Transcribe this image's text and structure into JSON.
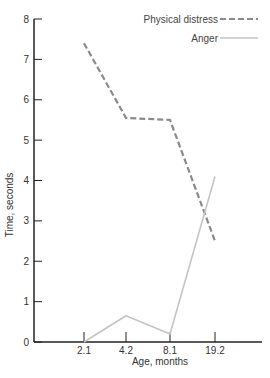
{
  "chart_data": {
    "type": "line",
    "title": "",
    "xlabel": "Age, months",
    "ylabel": "Time, seconds",
    "categories": [
      "2.1",
      "4.2",
      "8.1",
      "19.2"
    ],
    "ylim": [
      0,
      8
    ],
    "yticks": [
      "0",
      "1",
      "2",
      "3",
      "4",
      "5",
      "6",
      "7",
      "8"
    ],
    "grid": false,
    "legend_position": "top-right",
    "series": [
      {
        "name": "Physical distress",
        "style": "dashed",
        "color": "#8a8a8a",
        "values": [
          7.4,
          5.55,
          5.5,
          2.5
        ]
      },
      {
        "name": "Anger",
        "style": "solid",
        "color": "#c4c4c4",
        "values": [
          0.0,
          0.65,
          0.2,
          4.1
        ]
      }
    ]
  },
  "axis": {
    "x_title": "Age, months",
    "y_title": "Time, seconds"
  },
  "legend": {
    "items": [
      {
        "label": "Physical distress",
        "style": "dashed"
      },
      {
        "label": "Anger",
        "style": "solid"
      }
    ]
  }
}
